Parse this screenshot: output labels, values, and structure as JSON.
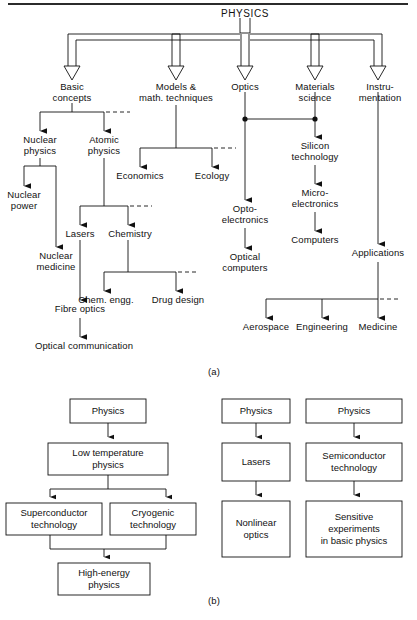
{
  "figure": {
    "top_rule": true,
    "panel_a_caption": "(a)",
    "panel_b_caption": "(b)",
    "ink_color": "#111111",
    "background_color": "#ffffff"
  },
  "panel_a": {
    "root": "PHYSICS",
    "level1": [
      "Basic\nconcepts",
      "Models &\nmath. techniques",
      "Optics",
      "Materials\nscience",
      "Instru-\nmentation"
    ],
    "nodes": {
      "nuclear_physics": "Nuclear\nphysics",
      "atomic_physics": "Atomic\nphysics",
      "nuclear_power": "Nuclear\npower",
      "nuclear_medicine": "Nuclear\nmedicine",
      "lasers": "Lasers",
      "chemistry": "Chemistry",
      "chem_engg": "Chem. engg.",
      "drug_design": "Drug design",
      "fibre_optics": "Fibre optics",
      "optical_communication": "Optical communication",
      "economics": "Economics",
      "ecology": "Ecology",
      "optoelectronics": "Opto-\nelectronics",
      "optical_computers": "Optical\ncomputers",
      "silicon_technology": "Silicon\ntechnology",
      "microelectronics": "Micro-\nelectronics",
      "computers": "Computers",
      "applications": "Applications",
      "aerospace": "Aerospace",
      "engineering": "Engineering",
      "medicine": "Medicine"
    }
  },
  "panel_b": {
    "chains": [
      {
        "name": "low-temperature-chain",
        "boxes": [
          "Physics",
          "Low temperature\nphysics",
          "Superconductor\ntechnology",
          "Cryogenic\ntechnology",
          "High-energy\nphysics"
        ]
      },
      {
        "name": "laser-chain",
        "boxes": [
          "Physics",
          "Lasers",
          "Nonlinear\noptics"
        ]
      },
      {
        "name": "semiconductor-chain",
        "boxes": [
          "Physics",
          "Semiconductor\ntechnology",
          "Sensitive\nexperiments\nin basic physics"
        ]
      }
    ]
  }
}
